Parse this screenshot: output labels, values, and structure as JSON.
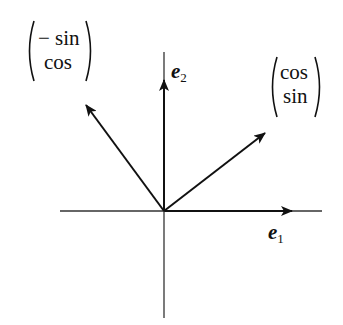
{
  "diagram": {
    "colors": {
      "ink": "#111111",
      "axis": "#333333",
      "background": "#ffffff"
    },
    "origin": [
      164,
      211
    ],
    "axes": {
      "horizontal": {
        "from": [
          60,
          211
        ],
        "to": [
          322,
          211
        ],
        "arrow_tip": [
          292,
          211
        ],
        "label_base": "e",
        "label_sub": "1"
      },
      "vertical": {
        "from": [
          164,
          318
        ],
        "to": [
          164,
          52
        ],
        "arrow_tip": [
          164,
          80
        ],
        "label_base": "e",
        "label_sub": "2"
      }
    },
    "vectors": [
      {
        "name": "rotated-e1",
        "tip": [
          265,
          133
        ],
        "label": {
          "top": "cos",
          "bottom": "sin"
        }
      },
      {
        "name": "rotated-e2",
        "tip": [
          86,
          105
        ],
        "label": {
          "top": "− sin",
          "bottom": "cos"
        }
      }
    ]
  }
}
